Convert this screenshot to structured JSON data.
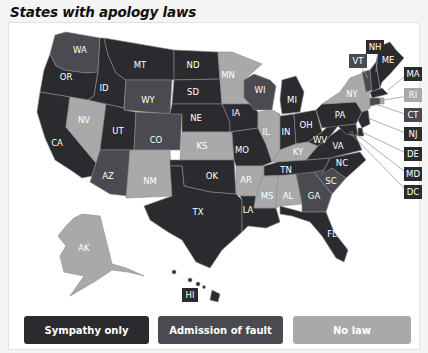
{
  "title": "States with apology laws",
  "colors": {
    "sympathy_only": "#2b2b2f",
    "admission_of_fault": "#4b4a50",
    "no_law": "#a9a9a9"
  },
  "legend": [
    {
      "key": "sympathy_only",
      "label": "Sympathy only"
    },
    {
      "key": "admission_of_fault",
      "label": "Admission of fault"
    },
    {
      "key": "no_law",
      "label": "No law"
    }
  ],
  "states": {
    "WA": "admission_of_fault",
    "OR": "sympathy_only",
    "CA": "sympathy_only",
    "NV": "no_law",
    "ID": "sympathy_only",
    "MT": "sympathy_only",
    "WY": "admission_of_fault",
    "UT": "sympathy_only",
    "AZ": "admission_of_fault",
    "CO": "admission_of_fault",
    "NM": "no_law",
    "ND": "sympathy_only",
    "SD": "sympathy_only",
    "NE": "sympathy_only",
    "KS": "no_law",
    "OK": "sympathy_only",
    "TX": "sympathy_only",
    "MN": "no_law",
    "IA": "sympathy_only",
    "MO": "sympathy_only",
    "AR": "no_law",
    "LA": "sympathy_only",
    "WI": "admission_of_fault",
    "IL": "no_law",
    "MI": "sympathy_only",
    "IN": "sympathy_only",
    "OH": "sympathy_only",
    "KY": "no_law",
    "TN": "sympathy_only",
    "MS": "no_law",
    "AL": "no_law",
    "GA": "admission_of_fault",
    "FL": "sympathy_only",
    "SC": "admission_of_fault",
    "NC": "sympathy_only",
    "VA": "sympathy_only",
    "WV": "sympathy_only",
    "PA": "sympathy_only",
    "NY": "no_law",
    "VT": "admission_of_fault",
    "NH": "sympathy_only",
    "ME": "sympathy_only",
    "MA": "sympathy_only",
    "RI": "no_law",
    "CT": "admission_of_fault",
    "NJ": "sympathy_only",
    "DE": "sympathy_only",
    "MD": "sympathy_only",
    "DC": "sympathy_only",
    "AK": "no_law",
    "HI": "sympathy_only"
  },
  "labels": {
    "WA": "WA",
    "OR": "OR",
    "CA": "CA",
    "NV": "NV",
    "ID": "ID",
    "MT": "MT",
    "WY": "WY",
    "UT": "UT",
    "AZ": "AZ",
    "CO": "CO",
    "NM": "NM",
    "ND": "ND",
    "SD": "SD",
    "NE": "NE",
    "KS": "KS",
    "OK": "OK",
    "TX": "TX",
    "MN": "MN",
    "IA": "IA",
    "MO": "MO",
    "AR": "AR",
    "LA": "LA",
    "WI": "WI",
    "IL": "IL",
    "MI": "MI",
    "IN": "IN",
    "OH": "OH",
    "KY": "KY",
    "TN": "TN",
    "MS": "MS",
    "AL": "AL",
    "GA": "GA",
    "FL": "FL",
    "SC": "SC",
    "NC": "NC",
    "VA": "VA",
    "WV": "WV",
    "PA": "PA",
    "NY": "NY",
    "VT": "VT",
    "NH": "NH",
    "ME": "ME",
    "MA": "MA",
    "RI": "RI",
    "CT": "CT",
    "NJ": "NJ",
    "DE": "DE",
    "MD": "MD",
    "DC": "DC",
    "AK": "AK",
    "HI": "HI"
  }
}
